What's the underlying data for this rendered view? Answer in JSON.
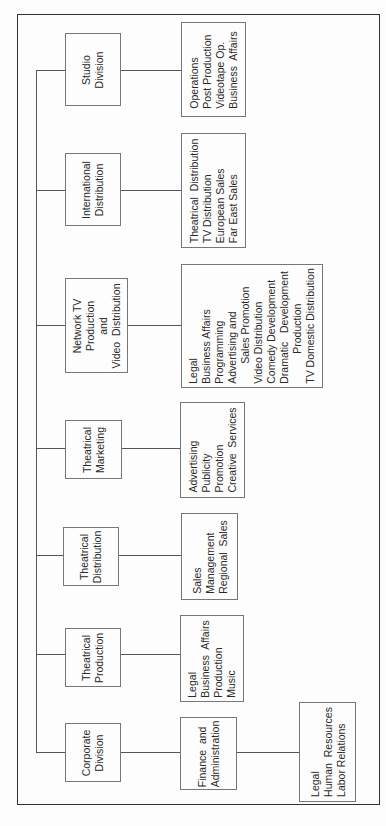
{
  "chart_title": "",
  "divisions": [
    {
      "name": [
        "Studio",
        "Division"
      ],
      "units": [
        "Operations",
        "Post Production",
        "Videotape Op.",
        "Business  Affairs"
      ]
    },
    {
      "name": [
        "International",
        "Distribution"
      ],
      "units": [
        "Theatrical  Distribution",
        "TV Distribution",
        "European Sales",
        "Far East Sales"
      ]
    },
    {
      "name": [
        "Network TV",
        "Production",
        "and",
        "Video  Distribution"
      ],
      "units": [
        "Legal",
        "Business Affairs",
        "Programming",
        "Advertising and",
        "Sales Promotion",
        "Video Distribution",
        "Comedy Development",
        "Dramatic   Development",
        "Production",
        "TV Domestic Distribution"
      ]
    },
    {
      "name": [
        "Theatrical",
        "Marketing"
      ],
      "units": [
        "Advertising",
        "Publicity",
        "Promotion",
        "Creative  Services"
      ]
    },
    {
      "name": [
        "Theatrical",
        "Distribution"
      ],
      "units": [
        "Sales",
        "Management",
        "Regional  Sales"
      ]
    },
    {
      "name": [
        "Theatrical",
        "Production"
      ],
      "units": [
        "Legal",
        "Business  Affairs",
        "Production",
        "Music"
      ]
    },
    {
      "name": [
        "Corporate",
        "Division"
      ],
      "units": [
        "Finance  and",
        "Administration"
      ],
      "sub_units": [
        "Legal",
        "Human  Resources",
        "Labor Relations"
      ]
    }
  ]
}
